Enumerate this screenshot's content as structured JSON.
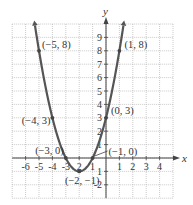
{
  "chart_data": {
    "type": "line",
    "title": "",
    "function": "y = x^2 + 4x + 3",
    "xlabel": "x",
    "ylabel": "y",
    "xlim": [
      -7,
      5
    ],
    "ylim": [
      -3,
      10
    ],
    "grid": true,
    "x_ticks": [
      -6,
      -5,
      -4,
      -3,
      -2,
      -1,
      1,
      2,
      3,
      4
    ],
    "y_ticks": [
      -2,
      -1,
      1,
      2,
      3,
      4,
      5,
      6,
      7,
      8,
      9
    ],
    "x_tick_labels": [
      "-6",
      "-5",
      "-4",
      "-3",
      "2",
      "1",
      "1",
      "2",
      "3",
      "4"
    ],
    "y_tick_labels": [
      "-2",
      "1",
      "1",
      "2",
      "3",
      "4",
      "5",
      "6",
      "7",
      "8",
      "9"
    ],
    "series": [
      {
        "name": "parabola",
        "color": "#555555",
        "x_range": [
          -5.3,
          1.3
        ]
      }
    ],
    "points": [
      {
        "x": -5,
        "y": 8,
        "label": "(−5, 8)"
      },
      {
        "x": 1,
        "y": 8,
        "label": "(1, 8)"
      },
      {
        "x": 0,
        "y": 3,
        "label": "(0, 3)"
      },
      {
        "x": -4,
        "y": 3,
        "label": "(−4, 3)"
      },
      {
        "x": -3,
        "y": 0,
        "label": "(−3, 0)"
      },
      {
        "x": -1,
        "y": 0,
        "label": "(−1, 0)"
      },
      {
        "x": -2,
        "y": -1,
        "label": "(−2, −1)"
      }
    ]
  }
}
